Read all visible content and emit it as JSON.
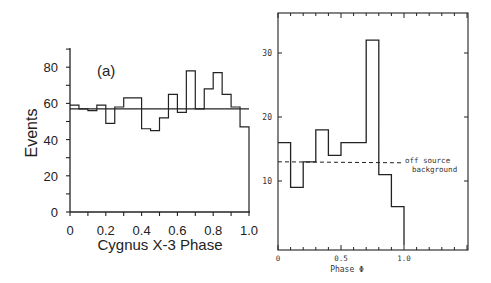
{
  "chart_data": [
    {
      "type": "bar",
      "subtype": "step-histogram",
      "panel_label": "(a)",
      "title": "",
      "xlabel": "Cygnus X-3 Phase",
      "ylabel": "Events",
      "xlim": [
        0,
        1.0
      ],
      "ylim": [
        0,
        90
      ],
      "x_ticks": [
        "0",
        "0.2",
        "0.4",
        "0.6",
        "0.8",
        "1.0"
      ],
      "y_ticks": [
        "0",
        "20",
        "40",
        "60",
        "80"
      ],
      "bin_width": 0.05,
      "bin_edges": [
        0,
        0.05,
        0.1,
        0.15,
        0.2,
        0.25,
        0.3,
        0.35,
        0.4,
        0.45,
        0.5,
        0.55,
        0.6,
        0.65,
        0.7,
        0.75,
        0.8,
        0.85,
        0.9,
        0.95,
        1.0
      ],
      "values": [
        59,
        57,
        56,
        59,
        49,
        58,
        63,
        63,
        46,
        45,
        52,
        65,
        55,
        78,
        57,
        68,
        77,
        65,
        58,
        47
      ],
      "reference_line": {
        "y": 57,
        "style": "solid",
        "label": ""
      },
      "grid": false
    },
    {
      "type": "bar",
      "subtype": "step-histogram",
      "title": "",
      "xlabel": "Phase Φ",
      "ylabel": "",
      "xlim": [
        0,
        1.5
      ],
      "ylim": [
        0,
        36
      ],
      "x_ticks": [
        "0",
        "0.5",
        "1.0"
      ],
      "y_ticks": [
        "10",
        "20",
        "30"
      ],
      "bin_width": 0.1,
      "bin_edges": [
        0,
        0.1,
        0.2,
        0.3,
        0.4,
        0.5,
        0.6,
        0.7,
        0.8,
        0.9,
        1.0
      ],
      "values": [
        16,
        9,
        13,
        18,
        14,
        16,
        16,
        32,
        11,
        6
      ],
      "reference_line": {
        "y": 13,
        "style": "dashed",
        "label": "off source background"
      },
      "annotation_lines": [
        "off source",
        "background"
      ],
      "grid": false
    }
  ],
  "left": {
    "panel_label": "(a)",
    "ylabel": "Events",
    "xlabel": "Cygnus X-3 Phase",
    "y_tick_labels": [
      "0",
      "20",
      "40",
      "60",
      "80"
    ],
    "x_tick_labels": [
      "0",
      "0.2",
      "0.4",
      "0.6",
      "0.8",
      "1.0"
    ]
  },
  "right": {
    "xlabel": "Phase Φ",
    "y_tick_labels": [
      "10",
      "20",
      "30"
    ],
    "x_tick_labels": [
      "0",
      "0.5",
      "1.0"
    ],
    "annotation_line1": "off source",
    "annotation_line2": "background"
  }
}
